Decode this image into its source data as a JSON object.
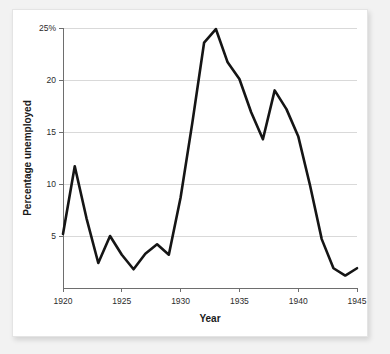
{
  "chart_data": {
    "type": "line",
    "title": "",
    "xlabel": "Year",
    "ylabel": "Percentage unemployed",
    "xlim": [
      1920,
      1945
    ],
    "ylim": [
      0,
      25
    ],
    "grid": true,
    "legend": "none",
    "x_ticks": [
      1920,
      1925,
      1930,
      1935,
      1940,
      1945
    ],
    "x_tick_labels": [
      "1920",
      "1925",
      "1930",
      "1935",
      "1940",
      "1945"
    ],
    "y_ticks": [
      5,
      10,
      15,
      20,
      25
    ],
    "y_tick_labels": [
      "5",
      "10",
      "15",
      "20",
      "25%"
    ],
    "line_color": "#151515",
    "x": [
      1920,
      1921,
      1922,
      1923,
      1924,
      1925,
      1926,
      1927,
      1928,
      1929,
      1930,
      1931,
      1932,
      1933,
      1934,
      1935,
      1936,
      1937,
      1938,
      1939,
      1940,
      1941,
      1942,
      1943,
      1944,
      1945
    ],
    "values": [
      5.2,
      11.7,
      6.7,
      2.4,
      5.0,
      3.2,
      1.8,
      3.3,
      4.2,
      3.2,
      8.7,
      15.9,
      23.6,
      24.9,
      21.7,
      20.1,
      16.9,
      14.3,
      19.0,
      17.2,
      14.6,
      9.9,
      4.7,
      1.9,
      1.2,
      1.9
    ]
  },
  "axis_titles": {
    "x": "Year",
    "y": "Percentage unemployed"
  }
}
